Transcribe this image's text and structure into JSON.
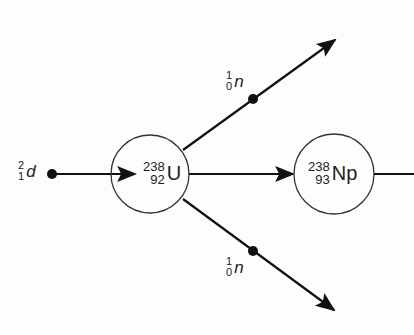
{
  "diagram": {
    "title": "",
    "colors": {
      "line": "#111111",
      "circle": "#333333",
      "text": "#222222",
      "background": "#fdfdfd"
    },
    "incoming": {
      "particle": {
        "mass_number": "2",
        "atomic_number": "1",
        "symbol": "d"
      }
    },
    "target": {
      "mass_number": "238",
      "atomic_number": "92",
      "symbol": "U"
    },
    "product": {
      "mass_number": "238",
      "atomic_number": "93",
      "symbol": "Np"
    },
    "emitted": [
      {
        "mass_number": "1",
        "atomic_number": "0",
        "symbol": "n",
        "direction": "up-right"
      },
      {
        "mass_number": "1",
        "atomic_number": "0",
        "symbol": "n",
        "direction": "down-right"
      }
    ]
  }
}
